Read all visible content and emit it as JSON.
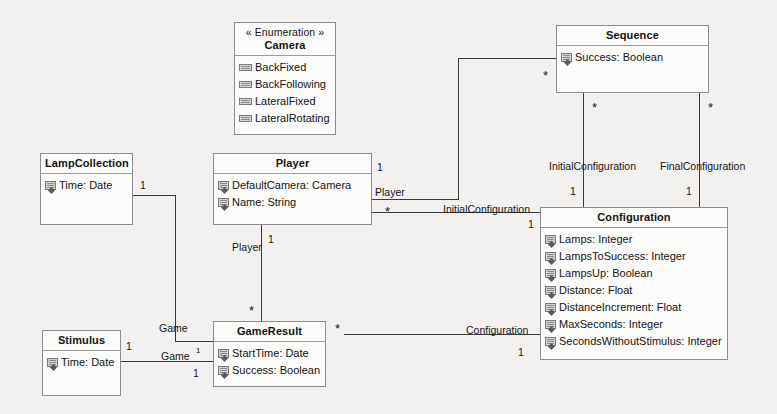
{
  "diagram": {
    "kind": "uml-class-diagram",
    "background": "#f2f1f0",
    "line_color": "#3a3a3a",
    "box_fill": "#fbfbfa",
    "box_border": "#8d8d8d"
  },
  "classes": {
    "camera": {
      "stereotype": "« Enumeration »",
      "name": "Camera",
      "literals": [
        "BackFixed",
        "BackFollowing",
        "LateralFixed",
        "LateralRotating"
      ]
    },
    "sequence": {
      "name": "Sequence",
      "attributes": [
        "Success: Boolean"
      ]
    },
    "lamp_collection": {
      "name": "LampCollection",
      "attributes": [
        "Time: Date"
      ]
    },
    "player": {
      "name": "Player",
      "attributes": [
        "DefaultCamera: Camera",
        "Name: String"
      ]
    },
    "configuration": {
      "name": "Configuration",
      "attributes": [
        "Lamps: Integer",
        "LampsToSuccess: Integer",
        "LampsUp: Boolean",
        "Distance: Float",
        "DistanceIncrement: Float",
        "MaxSeconds: Integer",
        "SecondsWithoutStimulus: Integer"
      ]
    },
    "stimulus": {
      "name": "Stimulus",
      "attributes": [
        "Time: Date"
      ]
    },
    "game_result": {
      "name": "GameResult",
      "attributes": [
        "StartTime: Date",
        "Success: Boolean"
      ]
    }
  },
  "association_labels": {
    "player_to_sequence_role": "Player",
    "player_to_config_role": "InitialConfiguration",
    "sequence_initial_config_role": "InitialConfiguration",
    "sequence_final_config_role": "FinalConfiguration",
    "gameresult_config_role": "Configuration",
    "player_gameresult_role": "Player",
    "lampcollection_game_role": "Game",
    "stimulus_game_role": "Game"
  },
  "multiplicities": {
    "player_right_one": "1",
    "player_right_star": "*",
    "sequence_left_star": "*",
    "player_config_one": "1",
    "seq_initial_star": "*",
    "seq_initial_one": "1",
    "seq_final_star": "*",
    "seq_final_one": "1",
    "lampcollection_one": "1",
    "player_gr_one": "1",
    "player_gr_star": "*",
    "gameresult_right_star": "*",
    "gameresult_config_one": "1",
    "stimulus_one": "1",
    "stimulus_game_sup": "1",
    "stimulus_game_one": "1"
  }
}
